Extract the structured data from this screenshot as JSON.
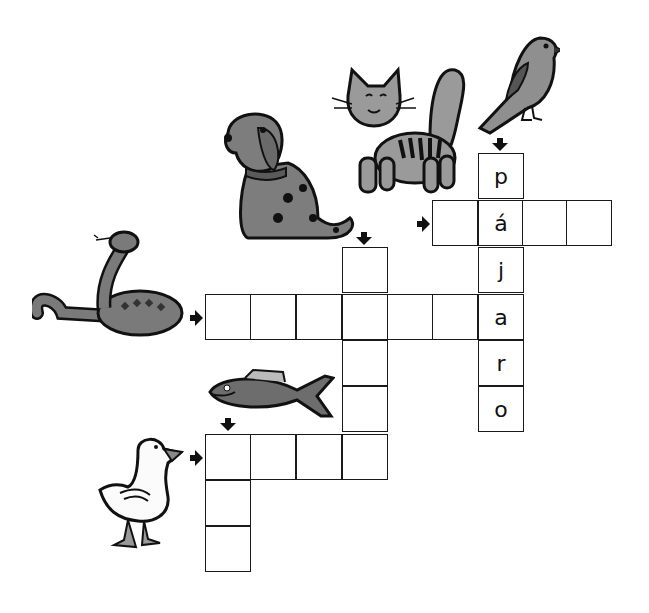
{
  "puzzle": {
    "type": "crossword",
    "language": "Spanish",
    "cell_size": 46,
    "words": [
      {
        "id": "bird",
        "clue_picture": "bird",
        "direction": "down",
        "length": 6,
        "answer_shown": [
          "p",
          "á",
          "j",
          "a",
          "r",
          "o"
        ],
        "start": [
          478,
          153
        ]
      },
      {
        "id": "cat",
        "clue_picture": "cat",
        "direction": "across",
        "length": 4,
        "answer_shown": [
          "",
          "á",
          "",
          ""
        ],
        "start": [
          432,
          200
        ]
      },
      {
        "id": "dog",
        "clue_picture": "dog",
        "direction": "down",
        "length": 5,
        "answer_shown": [
          "",
          "",
          "",
          "",
          ""
        ],
        "start": [
          342,
          247
        ]
      },
      {
        "id": "snake",
        "clue_picture": "snake",
        "direction": "across",
        "length": 7,
        "answer_shown": [
          "",
          "",
          "",
          "",
          "",
          "",
          "a"
        ],
        "start": [
          205,
          294
        ]
      },
      {
        "id": "fish",
        "clue_picture": "fish",
        "direction": "down",
        "length": 3,
        "answer_shown": [
          "",
          "",
          ""
        ],
        "start": [
          205,
          434
        ]
      },
      {
        "id": "duck",
        "clue_picture": "duck",
        "direction": "across",
        "length": 4,
        "answer_shown": [
          "",
          "",
          "",
          ""
        ],
        "start": [
          205,
          434
        ]
      }
    ],
    "letters": {
      "p": "p",
      "a_acute": "á",
      "j": "j",
      "a": "a",
      "r": "r",
      "o": "o"
    }
  },
  "colors": {
    "grid_line": "#1a1a1a",
    "animal_fill": "#8a8a8a",
    "animal_dark": "#5e5e5e",
    "outline": "#111111"
  }
}
